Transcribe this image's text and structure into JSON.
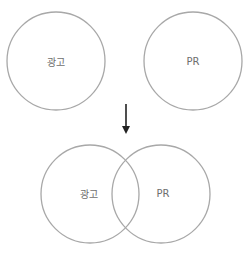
{
  "diagram": {
    "type": "venn-transition",
    "stroke_color": "#a8a8a8",
    "arrow_color": "#222222",
    "text_color": "#6e6e6e",
    "before": {
      "circles": [
        {
          "label": "광고",
          "cx": 56,
          "cy": 61,
          "r": 49
        },
        {
          "label": "PR",
          "cx": 193,
          "cy": 61,
          "r": 49
        }
      ]
    },
    "arrow": {
      "direction": "down",
      "x": 126,
      "y1": 104,
      "y2": 134
    },
    "after": {
      "circles": [
        {
          "label": "광고",
          "cx": 90,
          "cy": 194,
          "r": 49
        },
        {
          "label": "PR",
          "cx": 161,
          "cy": 194,
          "r": 49
        }
      ]
    }
  }
}
